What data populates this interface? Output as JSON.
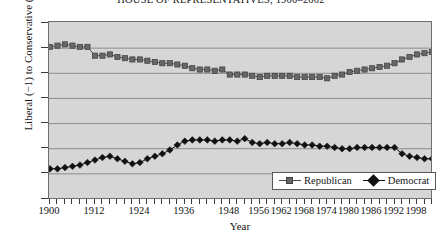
{
  "chart_data": {
    "type": "line",
    "title": "HOUSE OF REPRESENTATIVES, 1900–2002",
    "xlabel": "Year",
    "ylabel": "Liberal (−1) to Conservative (1)",
    "xlim": [
      1900,
      2002
    ],
    "ylim": [
      -0.7,
      0.7
    ],
    "yticks": [
      0.7,
      0.5,
      0.3,
      0.1,
      -0.1,
      -0.3,
      -0.5,
      -0.7
    ],
    "ytick_labels": [
      "0.7",
      "0.5",
      "0.3",
      "0.1",
      "−0.1",
      "−0.3",
      "−0.5",
      "−0.7"
    ],
    "xticks": [
      1900,
      1902,
      1904,
      1906,
      1908,
      1910,
      1912,
      1914,
      1916,
      1918,
      1920,
      1922,
      1924,
      1926,
      1928,
      1930,
      1932,
      1934,
      1936,
      1938,
      1940,
      1942,
      1944,
      1946,
      1948,
      1950,
      1952,
      1954,
      1956,
      1958,
      1960,
      1962,
      1964,
      1966,
      1968,
      1970,
      1972,
      1974,
      1976,
      1978,
      1980,
      1982,
      1984,
      1986,
      1988,
      1990,
      1992,
      1994,
      1996,
      1998,
      2000,
      2002
    ],
    "xtick_labels": [
      1900,
      1912,
      1924,
      1936,
      1948,
      1956,
      1962,
      1968,
      1974,
      1980,
      1986,
      1992,
      1998
    ],
    "grid": "horizontal",
    "legend_position": "bottom-right",
    "x": [
      1900,
      1902,
      1904,
      1906,
      1908,
      1910,
      1912,
      1914,
      1916,
      1918,
      1920,
      1922,
      1924,
      1926,
      1928,
      1930,
      1932,
      1934,
      1936,
      1938,
      1940,
      1942,
      1944,
      1946,
      1948,
      1950,
      1952,
      1954,
      1956,
      1958,
      1960,
      1962,
      1964,
      1966,
      1968,
      1970,
      1972,
      1974,
      1976,
      1978,
      1980,
      1982,
      1984,
      1986,
      1988,
      1990,
      1992,
      1994,
      1996,
      1998,
      2000,
      2002
    ],
    "series": [
      {
        "name": "Republican",
        "color": "#676767",
        "marker": "square",
        "values": [
          0.51,
          0.52,
          0.53,
          0.52,
          0.51,
          0.51,
          0.44,
          0.44,
          0.45,
          0.43,
          0.42,
          0.41,
          0.41,
          0.4,
          0.39,
          0.38,
          0.38,
          0.37,
          0.36,
          0.34,
          0.33,
          0.33,
          0.32,
          0.33,
          0.29,
          0.29,
          0.29,
          0.28,
          0.27,
          0.28,
          0.28,
          0.28,
          0.28,
          0.27,
          0.27,
          0.27,
          0.27,
          0.26,
          0.28,
          0.29,
          0.31,
          0.32,
          0.33,
          0.34,
          0.35,
          0.36,
          0.38,
          0.41,
          0.43,
          0.45,
          0.46,
          0.47
        ]
      },
      {
        "name": "Democrat",
        "color": "#111111",
        "marker": "diamond",
        "values": [
          -0.46,
          -0.46,
          -0.45,
          -0.44,
          -0.43,
          -0.41,
          -0.39,
          -0.37,
          -0.36,
          -0.38,
          -0.4,
          -0.42,
          -0.41,
          -0.38,
          -0.36,
          -0.34,
          -0.31,
          -0.27,
          -0.24,
          -0.23,
          -0.23,
          -0.23,
          -0.24,
          -0.23,
          -0.23,
          -0.24,
          -0.22,
          -0.25,
          -0.26,
          -0.25,
          -0.26,
          -0.26,
          -0.25,
          -0.26,
          -0.27,
          -0.27,
          -0.28,
          -0.28,
          -0.29,
          -0.3,
          -0.3,
          -0.29,
          -0.29,
          -0.29,
          -0.29,
          -0.29,
          -0.29,
          -0.34,
          -0.36,
          -0.37,
          -0.38,
          -0.38
        ]
      }
    ]
  },
  "legend": {
    "republican_label": "Republican",
    "democrat_label": "Democrat"
  }
}
